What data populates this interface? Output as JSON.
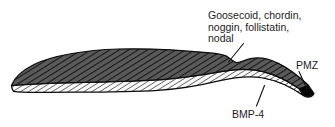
{
  "figure": {
    "background_color": "#ffffff",
    "labels": {
      "organizer": {
        "name": "organizer-signals-label",
        "lines": [
          "Goosecoid, chordin,",
          "noggin, follistatin,",
          "nodal"
        ],
        "line1": "Goosecoid, chordin,",
        "line2": "noggin, follistatin,",
        "line3": "nodal",
        "color": "#1b1b1b"
      },
      "pmz": {
        "name": "pmz-label",
        "text": "PMZ",
        "color": "#1b1b1b"
      },
      "bmp4": {
        "name": "bmp4-label",
        "text": "BMP-4",
        "color": "#1b1b1b"
      }
    },
    "regions": {
      "upper_layer": {
        "name": "dark-hatched-upper-layer",
        "fill_color": "#5a5a5a",
        "hatch_color": "#171717",
        "outline_color": "#0d0d0d"
      },
      "lower_layer": {
        "name": "light-hatched-lower-layer",
        "fill_color": "#fbfbfb",
        "hatch_color": "#2a2a2a",
        "outline_color": "#0d0d0d"
      },
      "pmz_wedge": {
        "name": "pmz-black-wedge",
        "fill_color": "#050505",
        "outline_color": "#050505"
      }
    },
    "leaders": {
      "organizer_leader": "organizer-leader-line",
      "pmz_leader": "pmz-leader-line",
      "bmp4_leader": "bmp4-leader-line"
    }
  }
}
